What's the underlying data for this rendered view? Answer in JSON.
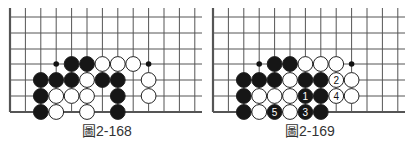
{
  "diagrams": [
    {
      "id": "left",
      "caption": "圖2-168",
      "offset_x": 10,
      "stones": [
        {
          "c": 4,
          "r": 3,
          "color": "black"
        },
        {
          "c": 5,
          "r": 3,
          "color": "black"
        },
        {
          "c": 6,
          "r": 3,
          "color": "white"
        },
        {
          "c": 7,
          "r": 3,
          "color": "white"
        },
        {
          "c": 8,
          "r": 3,
          "color": "white"
        },
        {
          "c": 2,
          "r": 4,
          "color": "black"
        },
        {
          "c": 3,
          "r": 4,
          "color": "black"
        },
        {
          "c": 4,
          "r": 4,
          "color": "black"
        },
        {
          "c": 5,
          "r": 4,
          "color": "white"
        },
        {
          "c": 6,
          "r": 4,
          "color": "black"
        },
        {
          "c": 7,
          "r": 4,
          "color": "black"
        },
        {
          "c": 9,
          "r": 4,
          "color": "white"
        },
        {
          "c": 2,
          "r": 5,
          "color": "black"
        },
        {
          "c": 3,
          "r": 5,
          "color": "white"
        },
        {
          "c": 4,
          "r": 5,
          "color": "white"
        },
        {
          "c": 5,
          "r": 5,
          "color": "white"
        },
        {
          "c": 7,
          "r": 5,
          "color": "black"
        },
        {
          "c": 9,
          "r": 5,
          "color": "white"
        },
        {
          "c": 2,
          "r": 6,
          "color": "black"
        },
        {
          "c": 3,
          "r": 6,
          "color": "white"
        },
        {
          "c": 5,
          "r": 6,
          "color": "white"
        },
        {
          "c": 7,
          "r": 6,
          "color": "black"
        }
      ],
      "markers": [
        {
          "c": 3,
          "r": 3
        },
        {
          "c": 9,
          "r": 3
        }
      ]
    },
    {
      "id": "right",
      "caption": "圖2-169",
      "offset_x": 213,
      "stones": [
        {
          "c": 4,
          "r": 3,
          "color": "black"
        },
        {
          "c": 5,
          "r": 3,
          "color": "black"
        },
        {
          "c": 6,
          "r": 3,
          "color": "white"
        },
        {
          "c": 7,
          "r": 3,
          "color": "white"
        },
        {
          "c": 8,
          "r": 3,
          "color": "white"
        },
        {
          "c": 2,
          "r": 4,
          "color": "black"
        },
        {
          "c": 3,
          "r": 4,
          "color": "black"
        },
        {
          "c": 4,
          "r": 4,
          "color": "black"
        },
        {
          "c": 5,
          "r": 4,
          "color": "white"
        },
        {
          "c": 6,
          "r": 4,
          "color": "black"
        },
        {
          "c": 7,
          "r": 4,
          "color": "black"
        },
        {
          "c": 8,
          "r": 4,
          "color": "white",
          "label": "2"
        },
        {
          "c": 9,
          "r": 4,
          "color": "white"
        },
        {
          "c": 2,
          "r": 5,
          "color": "black"
        },
        {
          "c": 3,
          "r": 5,
          "color": "white"
        },
        {
          "c": 4,
          "r": 5,
          "color": "white"
        },
        {
          "c": 5,
          "r": 5,
          "color": "white"
        },
        {
          "c": 6,
          "r": 5,
          "color": "black",
          "label": "1"
        },
        {
          "c": 7,
          "r": 5,
          "color": "black"
        },
        {
          "c": 8,
          "r": 5,
          "color": "white",
          "label": "4"
        },
        {
          "c": 9,
          "r": 5,
          "color": "white"
        },
        {
          "c": 2,
          "r": 6,
          "color": "black"
        },
        {
          "c": 3,
          "r": 6,
          "color": "white"
        },
        {
          "c": 4,
          "r": 6,
          "color": "black",
          "label": "5"
        },
        {
          "c": 5,
          "r": 6,
          "color": "white"
        },
        {
          "c": 6,
          "r": 6,
          "color": "black",
          "label": "3"
        },
        {
          "c": 7,
          "r": 6,
          "color": "black"
        }
      ],
      "markers": [
        {
          "c": 3,
          "r": 3
        },
        {
          "c": 9,
          "r": 3
        }
      ]
    }
  ]
}
